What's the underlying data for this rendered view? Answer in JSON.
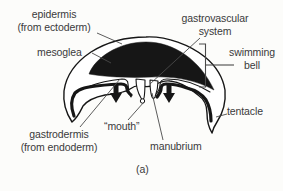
{
  "figure": {
    "caption": "(a)",
    "colors": {
      "ink": "#161616",
      "text": "#3a3a3a",
      "background": "#fcfcfa",
      "body_fill": "#ffffff",
      "mesoglea_fill": "#161616"
    },
    "labels": {
      "epidermis_l1": "epidermis",
      "epidermis_l2": "(from ectoderm)",
      "mesoglea": "mesoglea",
      "gastrovascular_l1": "gastrovascular",
      "gastrovascular_l2": "system",
      "swimming_l1": "swimming",
      "swimming_l2": "bell",
      "tentacle": "tentacle",
      "gastrodermis_l1": "gastrodermis",
      "gastrodermis_l2": "(from endoderm)",
      "mouth": "“mouth”",
      "manubrium": "manubrium"
    }
  }
}
